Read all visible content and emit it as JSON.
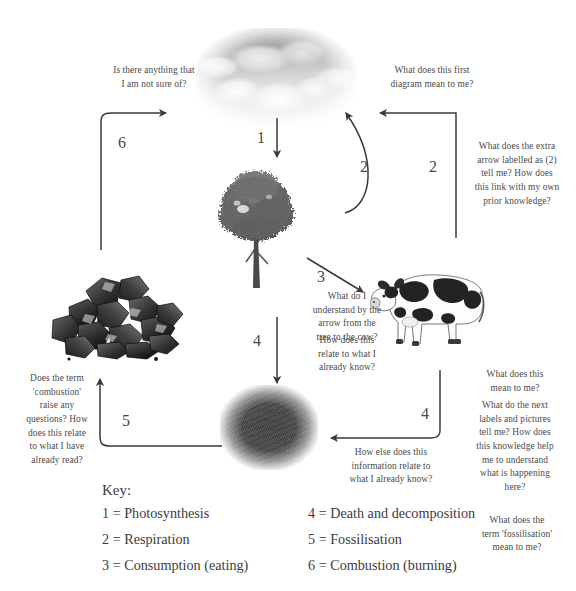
{
  "diagram": {
    "images": [
      {
        "name": "clouds",
        "caption": "clouds / atmosphere photograph"
      },
      {
        "name": "tree",
        "caption": "broadleaf tree photograph"
      },
      {
        "name": "cow",
        "caption": "black and white dairy cow photograph"
      },
      {
        "name": "coal",
        "caption": "pile of coal photograph"
      },
      {
        "name": "soil",
        "caption": "dark soil / decomposition photograph"
      }
    ],
    "arrow_labels": {
      "one": "1",
      "two_inner": "2",
      "two_outer": "2",
      "three": "3",
      "four_tree_soil": "4",
      "four_cow_soil": "4",
      "five": "5",
      "six": "6"
    }
  },
  "annotations": {
    "top_left": "Is there anything that\nI am not sure of?",
    "top_right": "What does this first\ndiagram mean to me?",
    "right_upper": "What does the extra\narrow labelled as (2)\ntell me? How does\nthis link with my own\nprior knowledge?",
    "centre_a": "What do I\nunderstand by the\narrow from the\ntree to the cow?",
    "centre_b": "How does this\nrelate to what I\nalready know?",
    "right_mid_a": "What does this\nmean to me?",
    "right_mid_b": "What do the next\nlabels and pictures\ntell me? How does\nthis knowledge help\nme to understand\nwhat is happening\nhere?",
    "bottom_centre": "How else does this\ninformation relate to\nwhat I already know?",
    "left_lower": "Does the term\n'combustion'\nraise any\nquestions? How\ndoes this relate\nto what I have\nalready read?",
    "bottom_right": "What does the\nterm 'fossilisation'\nmean to me?"
  },
  "key": {
    "title": "Key:",
    "left_column": [
      "1 = Photosynthesis",
      "2 = Respiration",
      "3 = Consumption (eating)"
    ],
    "right_column": [
      "4 = Death and decomposition",
      "5 = Fossilisation",
      "6 = Combustion (burning)"
    ]
  },
  "colors": {
    "text": "#4a4a4a",
    "arrow": "#3a3a3a",
    "background": "#ffffff"
  }
}
